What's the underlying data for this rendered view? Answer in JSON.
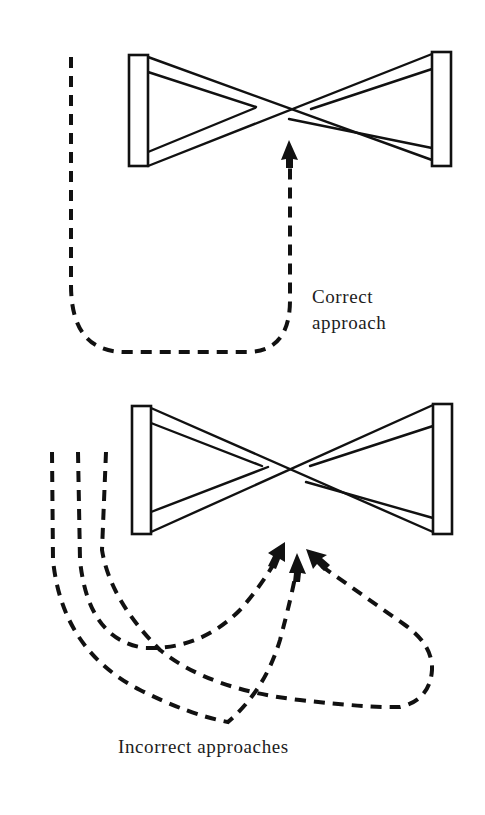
{
  "diagram": {
    "colors": {
      "ink": "#111111",
      "background": "#ffffff"
    },
    "panels": [
      {
        "id": "correct",
        "label_lines": [
          "Correct",
          "approach"
        ],
        "fence": {
          "type": "cross-pole",
          "left_post": {
            "x": 129,
            "y": 55,
            "w": 19,
            "h": 111
          },
          "right_post": {
            "x": 432,
            "y": 52,
            "w": 19,
            "h": 114
          }
        },
        "approach_paths": [
          {
            "name": "correct-path",
            "arrow_tip": [
              289,
              141
            ]
          }
        ]
      },
      {
        "id": "incorrect",
        "label": "Incorrect approaches",
        "fence": {
          "type": "cross-pole",
          "left_post": {
            "x": 132,
            "y": 406,
            "w": 19,
            "h": 128
          },
          "right_post": {
            "x": 433,
            "y": 404,
            "w": 19,
            "h": 130
          }
        },
        "approach_paths": [
          {
            "name": "incorrect-path-short-turn",
            "arrow_tip": [
              284,
              543
            ]
          },
          {
            "name": "incorrect-path-sharp-turn",
            "arrow_tip": [
              297,
              553
            ]
          },
          {
            "name": "incorrect-path-loop",
            "arrow_tip": [
              306,
              549
            ]
          }
        ]
      }
    ]
  },
  "labels": {
    "correct_line1": "Correct",
    "correct_line2": "approach",
    "incorrect": "Incorrect approaches"
  }
}
